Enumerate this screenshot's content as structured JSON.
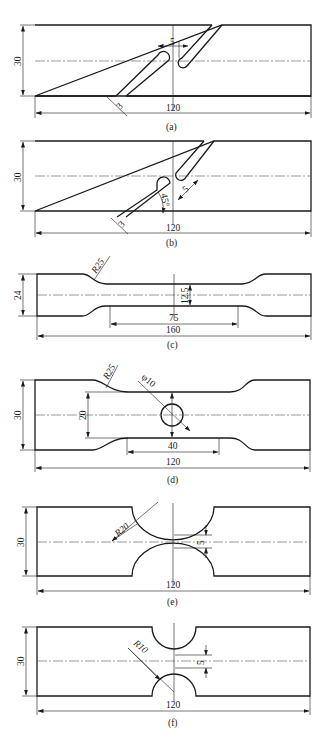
{
  "figure": {
    "panels": [
      {
        "id": "a",
        "caption": "(a)",
        "dims": {
          "height": "30",
          "length": "120",
          "gap": "5",
          "slot_width": "3"
        }
      },
      {
        "id": "b",
        "caption": "(b)",
        "dims": {
          "height": "30",
          "length": "120",
          "offset": "5",
          "slot_width": "3",
          "angle": "45°"
        }
      },
      {
        "id": "c",
        "caption": "(c)",
        "dims": {
          "height": "24",
          "length": "160",
          "gauge_length": "75",
          "gauge_width": "12.5",
          "radius": "R25"
        }
      },
      {
        "id": "d",
        "caption": "(d)",
        "dims": {
          "height": "30",
          "length": "120",
          "gauge_length": "40",
          "gauge_width": "20",
          "radius": "R25",
          "hole": "φ10"
        }
      },
      {
        "id": "e",
        "caption": "(e)",
        "dims": {
          "height": "30",
          "length": "120",
          "radius": "R20",
          "ligament": "5"
        }
      },
      {
        "id": "f",
        "caption": "(f)",
        "dims": {
          "height": "30",
          "length": "120",
          "radius": "R10",
          "ligament": "5"
        }
      }
    ]
  }
}
